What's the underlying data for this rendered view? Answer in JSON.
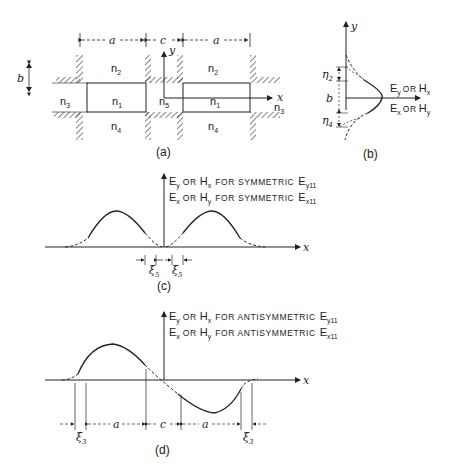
{
  "figure": {
    "panel_a": {
      "caption": "(a)",
      "dim_labels": {
        "a_left": "a",
        "c": "c",
        "a_right": "a",
        "b": "b"
      },
      "regions": [
        {
          "id": "n2_left",
          "label": "n",
          "sub": "2"
        },
        {
          "id": "n2_right",
          "label": "n",
          "sub": "2"
        },
        {
          "id": "n1_left",
          "label": "n",
          "sub": "1"
        },
        {
          "id": "n1_right",
          "label": "n",
          "sub": "1"
        },
        {
          "id": "n3_left",
          "label": "n",
          "sub": "3"
        },
        {
          "id": "n3_right",
          "label": "n",
          "sub": "3"
        },
        {
          "id": "n4_left",
          "label": "n",
          "sub": "4"
        },
        {
          "id": "n4_right",
          "label": "n",
          "sub": "4"
        },
        {
          "id": "n5",
          "label": "n",
          "sub": "5"
        }
      ],
      "axes": {
        "x": "x",
        "y": "y"
      }
    },
    "panel_b": {
      "caption": "(b)",
      "axis_y": "y",
      "labels": {
        "eta2": "η",
        "eta2_sub": "2",
        "b": "b",
        "eta4": "η",
        "eta4_sub": "4"
      },
      "field_upper": {
        "E": "E",
        "Esub": "y",
        "or": "OR",
        "H": "H",
        "Hsub": "x"
      },
      "field_lower": {
        "E": "E",
        "Esub": "x",
        "or": "OR",
        "H": "H",
        "Hsub": "y"
      }
    },
    "panel_c": {
      "caption": "(c)",
      "axis_x": "x",
      "legend_line1": {
        "E": "E",
        "Esub": "y",
        "or": "OR",
        "H": "H",
        "Hsub": "x",
        "text": "FOR SYMMETRIC",
        "mode": "E",
        "mode_sub": "y11"
      },
      "legend_line2": {
        "E": "E",
        "Esub": "x",
        "or": "OR",
        "H": "H",
        "Hsub": "y",
        "text": "FOR SYMMETRIC",
        "mode": "E",
        "mode_sub": "x11"
      },
      "xi_labels": [
        {
          "label": "ξ",
          "sub": "5"
        },
        {
          "label": "ξ",
          "sub": "5"
        }
      ]
    },
    "panel_d": {
      "caption": "(d)",
      "axis_x": "x",
      "legend_line1": {
        "E": "E",
        "Esub": "y",
        "or": "OR",
        "H": "H",
        "Hsub": "x",
        "text": "FOR ANTISYMMETRIC",
        "mode": "E",
        "mode_sub": "y11"
      },
      "legend_line2": {
        "E": "E",
        "Esub": "x",
        "or": "OR",
        "H": "H",
        "Hsub": "y",
        "text": "FOR ANTISYMMETRIC",
        "mode": "E",
        "mode_sub": "x11"
      },
      "dim_labels": {
        "a_left": "a",
        "c": "c",
        "a_right": "a"
      },
      "xi_labels": [
        {
          "label": "ξ",
          "sub": "3"
        },
        {
          "label": "ξ",
          "sub": "3"
        }
      ]
    }
  }
}
